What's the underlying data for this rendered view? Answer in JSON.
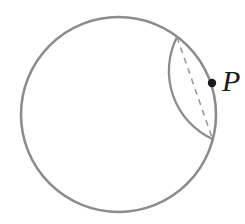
{
  "figure": {
    "canvas": {
      "width": 245,
      "height": 224,
      "background": "#ffffff"
    },
    "circle": {
      "cx": 118.5,
      "cy": 114.5,
      "r": 97.5
    },
    "fold": {
      "arc_path": "M 177 37 A 75 75 0 0 0 212.5 139",
      "crease": {
        "x1": 177,
        "y1": 37,
        "x2": 212.5,
        "y2": 139
      }
    },
    "point_P": {
      "label": "P",
      "dot_cx": 212,
      "dot_cy": 83,
      "dot_r": 4.2,
      "label_x": 222,
      "label_y": 91
    }
  },
  "colors": {
    "outline": "#8c8c8c",
    "crease": "#9a9a9a",
    "point": "#1a1a1a"
  }
}
